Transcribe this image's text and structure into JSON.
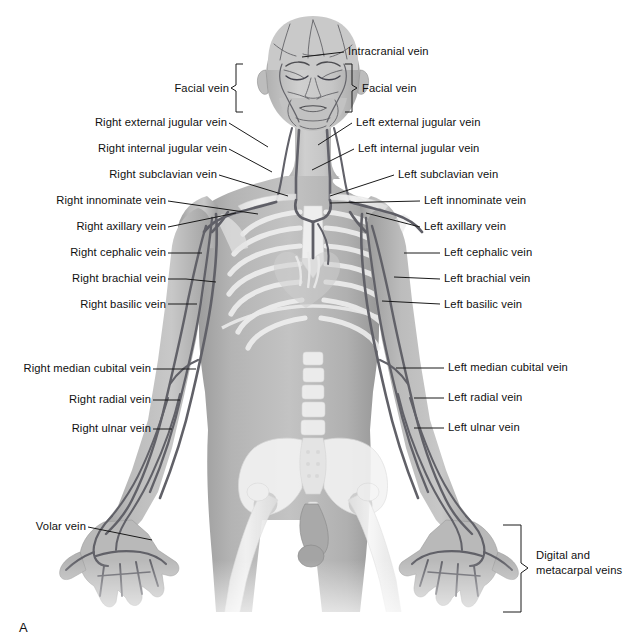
{
  "figure": {
    "panel_letter": "A",
    "background": "#ffffff",
    "label_color": "#101010",
    "leader_color": "#1a1a1a",
    "body_fill": "#a8a8a8",
    "bone_fill": "#f2f2f2",
    "vein_color": "#6f6f73"
  },
  "labels_right_side": [
    {
      "id": "right-external-jugular-vein",
      "text": "Right external jugular vein",
      "x": 104,
      "y": 120,
      "anchor": "right",
      "text_right": 226,
      "leader": "diagonal-down-right",
      "target": {
        "x": 268,
        "y": 147
      }
    },
    {
      "id": "right-internal-jugular-vein",
      "text": "Right internal jugular vein",
      "x": 112,
      "y": 146,
      "anchor": "right",
      "text_right": 226,
      "leader": "diagonal-down-right",
      "target": {
        "x": 272,
        "y": 172
      }
    },
    {
      "id": "right-subclavian-vein",
      "text": "Right subclavian vein",
      "x": 88,
      "y": 172,
      "anchor": "right",
      "text_right": 216,
      "leader": "diagonal-down-right",
      "target": {
        "x": 288,
        "y": 196
      }
    },
    {
      "id": "right-innominate-vein",
      "text": "Right innominate vein",
      "x": 37,
      "y": 198,
      "anchor": "right",
      "text_right": 165,
      "leader": "diagonal-down-right",
      "target": {
        "x": 255,
        "y": 214
      }
    },
    {
      "id": "right-axillary-vein",
      "text": "Right axillary vein",
      "x": 58,
      "y": 224,
      "anchor": "right",
      "text_right": 165,
      "leader": "diagonal-up-right",
      "target": {
        "x": 235,
        "y": 214
      }
    },
    {
      "id": "right-cephalic-vein",
      "text": "Right cephalic vein",
      "x": 52,
      "y": 250,
      "anchor": "right",
      "text_right": 165,
      "leader": "horizontal",
      "target": {
        "x": 202,
        "y": 254
      }
    },
    {
      "id": "right-brachial-vein",
      "text": "Right brachial vein",
      "x": 54,
      "y": 276,
      "anchor": "right",
      "text_right": 165,
      "leader": "horizontal",
      "target": {
        "x": 216,
        "y": 279
      }
    },
    {
      "id": "right-basilic-vein",
      "text": "Right basilic vein",
      "x": 62,
      "y": 302,
      "anchor": "right",
      "text_right": 165,
      "leader": "horizontal",
      "target": {
        "x": 196,
        "y": 304
      }
    },
    {
      "id": "right-median-cubital-vein",
      "text": "Right median cubital vein",
      "x": 18,
      "y": 366,
      "anchor": "right",
      "text_right": 150,
      "leader": "horizontal",
      "target": {
        "x": 196,
        "y": 368
      }
    },
    {
      "id": "right-radial-vein",
      "text": "Right radial vein",
      "x": 46,
      "y": 398,
      "anchor": "right",
      "text_right": 150,
      "leader": "horizontal",
      "target": {
        "x": 178,
        "y": 400
      }
    },
    {
      "id": "right-ulnar-vein",
      "text": "Right ulnar vein",
      "x": 40,
      "y": 426,
      "anchor": "right",
      "text_right": 150,
      "leader": "horizontal",
      "target": {
        "x": 168,
        "y": 428
      }
    },
    {
      "id": "volar-vein",
      "text": "Volar vein",
      "x": 22,
      "y": 523,
      "anchor": "right",
      "text_right": 84,
      "leader": "horizontal-then-diagonal",
      "target": {
        "x": 152,
        "y": 538
      }
    }
  ],
  "labels_left_side": [
    {
      "id": "intracranial-vein",
      "text": "Intracranial vein",
      "x": 348,
      "y": 49,
      "anchor": "left",
      "leader": "horizontal-left",
      "target": {
        "x": 302,
        "y": 54
      }
    },
    {
      "id": "left-external-jugular-vein",
      "text": "Left external jugular vein",
      "x": 356,
      "y": 120,
      "anchor": "left",
      "leader": "diagonal-down-left",
      "target": {
        "x": 320,
        "y": 144
      }
    },
    {
      "id": "left-internal-jugular-vein",
      "text": "Left internal jugular vein",
      "x": 358,
      "y": 146,
      "anchor": "left",
      "leader": "diagonal-down-left",
      "target": {
        "x": 314,
        "y": 168
      }
    },
    {
      "id": "left-subclavian-vein",
      "text": "Left subclavian vein",
      "x": 398,
      "y": 172,
      "anchor": "left",
      "leader": "diagonal-down-left",
      "target": {
        "x": 330,
        "y": 196
      }
    },
    {
      "id": "left-innominate-vein",
      "text": "Left innominate vein",
      "x": 424,
      "y": 198,
      "anchor": "left",
      "leader": "horizontal-left",
      "target": {
        "x": 330,
        "y": 203
      }
    },
    {
      "id": "left-axillary-vein",
      "text": "Left axillary vein",
      "x": 424,
      "y": 224,
      "anchor": "left",
      "leader": "diagonal-up-left",
      "target": {
        "x": 366,
        "y": 214
      }
    },
    {
      "id": "left-cephalic-vein",
      "text": "Left cephalic vein",
      "x": 444,
      "y": 250,
      "anchor": "left",
      "leader": "horizontal-left",
      "target": {
        "x": 404,
        "y": 252
      }
    },
    {
      "id": "left-brachial-vein",
      "text": "Left brachial vein",
      "x": 444,
      "y": 276,
      "anchor": "left",
      "leader": "horizontal-left",
      "target": {
        "x": 394,
        "y": 276
      }
    },
    {
      "id": "left-basilic-vein",
      "text": "Left basilic vein",
      "x": 444,
      "y": 302,
      "anchor": "left",
      "leader": "horizontal-left",
      "target": {
        "x": 382,
        "y": 300
      }
    },
    {
      "id": "left-median-cubital-vein",
      "text": "Left median cubital vein",
      "x": 448,
      "y": 364,
      "anchor": "left",
      "leader": "horizontal-left",
      "target": {
        "x": 396,
        "y": 366
      }
    },
    {
      "id": "left-radial-vein",
      "text": "Left radial vein",
      "x": 448,
      "y": 394,
      "anchor": "left",
      "leader": "horizontal-left",
      "target": {
        "x": 414,
        "y": 397
      }
    },
    {
      "id": "left-ulnar-vein",
      "text": "Left ulnar vein",
      "x": 448,
      "y": 424,
      "anchor": "left",
      "leader": "horizontal-left",
      "target": {
        "x": 414,
        "y": 427
      }
    }
  ],
  "bracket_labels": [
    {
      "id": "facial-vein-right",
      "text": "Facial vein",
      "x": 180,
      "y": 86,
      "anchor": "right",
      "text_right": 228,
      "bracket": {
        "side": "right-of-text",
        "x": 236,
        "y_top": 64,
        "y_bottom": 112,
        "tip_x": 231,
        "tip_y": 88
      }
    },
    {
      "id": "facial-vein-left",
      "text": "Facial vein",
      "x": 362,
      "y": 86,
      "anchor": "left",
      "bracket": {
        "side": "left-of-text",
        "x": 352,
        "y_top": 64,
        "y_bottom": 112,
        "tip_x": 357,
        "tip_y": 88
      }
    },
    {
      "id": "digital-and-metacarpal-veins",
      "text_line1": "Digital and",
      "text_line2": "metacarpal veins",
      "x": 536,
      "y": 556,
      "anchor": "left",
      "bracket": {
        "side": "left-of-text",
        "x": 521,
        "y_top": 525,
        "y_bottom": 612,
        "tip_x": 528,
        "tip_y": 568
      }
    }
  ]
}
